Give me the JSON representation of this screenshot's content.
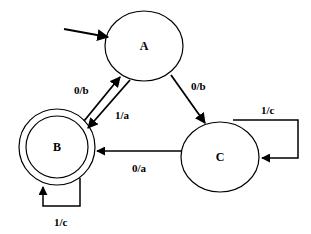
{
  "diagram": {
    "type": "finite-state-machine",
    "initial_state": "A",
    "states": [
      {
        "id": "A",
        "label": "A",
        "accepting": false
      },
      {
        "id": "B",
        "label": "B",
        "accepting": true
      },
      {
        "id": "C",
        "label": "C",
        "accepting": false
      }
    ],
    "transitions": [
      {
        "from": "B",
        "to": "A",
        "label": "0/b"
      },
      {
        "from": "A",
        "to": "B",
        "label": "1/a"
      },
      {
        "from": "A",
        "to": "C",
        "label": "0/b"
      },
      {
        "from": "C",
        "to": "B",
        "label": "0/a"
      },
      {
        "from": "C",
        "to": "C",
        "label": "1/c"
      },
      {
        "from": "B",
        "to": "B",
        "label": "1/c"
      }
    ]
  },
  "labels": {
    "state_a": "A",
    "state_b": "B",
    "state_c": "C",
    "edge_b_to_a": "0/b",
    "edge_a_to_b": "1/a",
    "edge_a_to_c": "0/b",
    "edge_c_to_b": "0/a",
    "edge_c_self": "1/c",
    "edge_b_self": "1/c"
  },
  "colors": {
    "stroke": "#000000",
    "background": "#ffffff"
  }
}
